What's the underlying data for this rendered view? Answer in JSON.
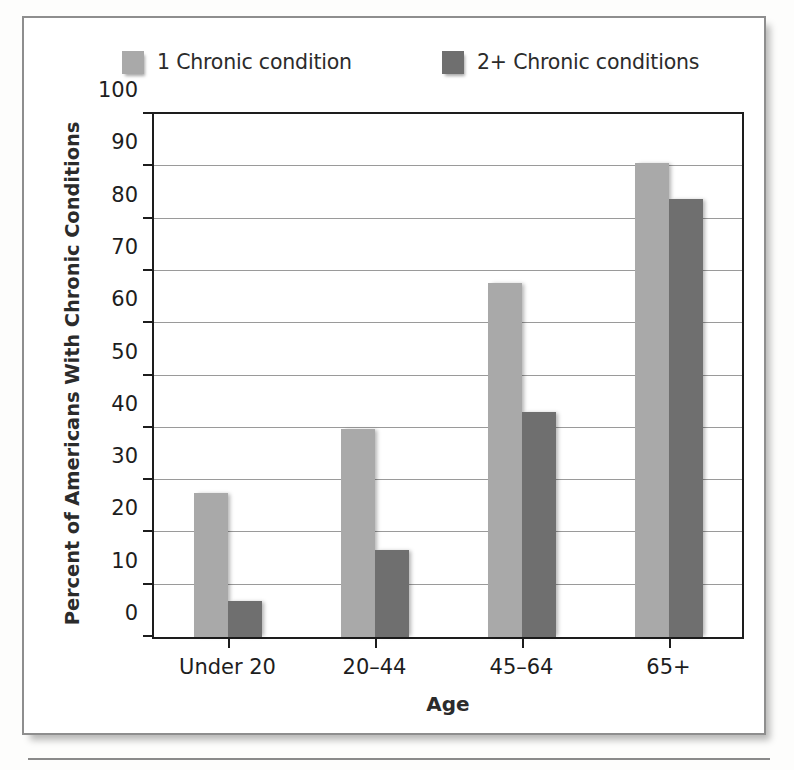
{
  "chart_data": {
    "type": "bar",
    "title": "",
    "xlabel": "Age",
    "ylabel": "Percent of Americans With Chronic Conditions",
    "categories": [
      "Under 20",
      "20–44",
      "45–64",
      "65+"
    ],
    "series": [
      {
        "name": "1 Chronic condition",
        "color": "#a9a9a9",
        "values": [
          27.5,
          39.8,
          67.7,
          90.7
        ]
      },
      {
        "name": "2+ Chronic conditions",
        "color": "#6f6f6f",
        "values": [
          6.9,
          16.7,
          43.0,
          83.7
        ]
      }
    ],
    "ylim": [
      0,
      100
    ],
    "yticks": [
      0,
      10,
      20,
      30,
      40,
      50,
      60,
      70,
      80,
      90,
      100
    ],
    "ytick_labels": [
      "0",
      "10",
      "20",
      "30",
      "40",
      "50",
      "60",
      "70",
      "80",
      "90",
      "100"
    ],
    "grid": true,
    "legend_position": "top"
  },
  "legend": {
    "items": [
      {
        "label": "1 Chronic condition",
        "color": "#a9a9a9"
      },
      {
        "label": "2+ Chronic conditions",
        "color": "#6f6f6f"
      }
    ]
  },
  "axes": {
    "x_title": "Age",
    "y_title": "Percent of Americans With Chronic Conditions"
  }
}
